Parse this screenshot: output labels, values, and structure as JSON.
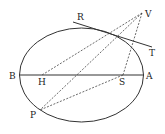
{
  "diagram": {
    "labels": {
      "R": "R",
      "V": "V",
      "T": "T",
      "B": "B",
      "H": "H",
      "S": "S",
      "A": "A",
      "P": "P"
    },
    "ellipse": {
      "cx": 81.5,
      "cy": 75,
      "rx": 62,
      "ry": 47
    },
    "colors": {
      "stroke": "#333333",
      "background": "#ffffff"
    }
  }
}
